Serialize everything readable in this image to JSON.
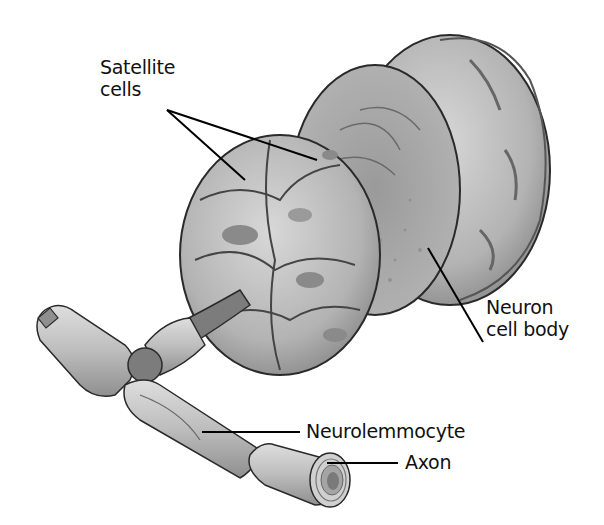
{
  "figure": {
    "labels": {
      "satellite_line1": "Satellite",
      "satellite_line2": "cells",
      "neuron_line1": "Neuron",
      "neuron_line2": "cell body",
      "neurolemmocyte": "Neurolemmocyte",
      "axon": "Axon"
    },
    "colors": {
      "background": "#ffffff",
      "cell_light": "#c8c8c8",
      "cell_mid": "#a9a9a9",
      "cell_dark": "#7c7c7c",
      "outline": "#2a2a2a",
      "leader_line": "#000000"
    }
  }
}
